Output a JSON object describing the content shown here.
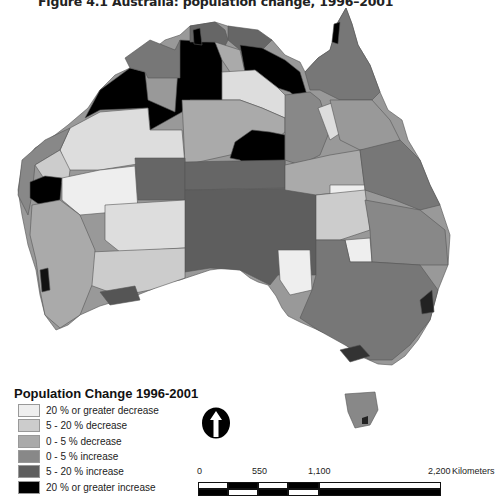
{
  "figure": {
    "title": "Figure 4.1  Australia: population change, 1996–2001"
  },
  "legend": {
    "title": "Population Change 1996-2001",
    "items": [
      {
        "label": "20 % or greater decrease",
        "color": "#eeeeee"
      },
      {
        "label": "5 - 20 % decrease",
        "color": "#cccccc"
      },
      {
        "label": "0 - 5 % decrease",
        "color": "#aaaaaa"
      },
      {
        "label": "0 - 5 % increase",
        "color": "#888888"
      },
      {
        "label": "5 - 20 % increase",
        "color": "#5e5e5e"
      },
      {
        "label": "20 % or greater increase",
        "color": "#000000"
      }
    ]
  },
  "north_arrow": {
    "icon": "north-arrow-icon"
  },
  "scale_bar": {
    "ticks": [
      "0",
      "550",
      "1,100",
      "2,200"
    ],
    "unit": "Kilometers"
  }
}
